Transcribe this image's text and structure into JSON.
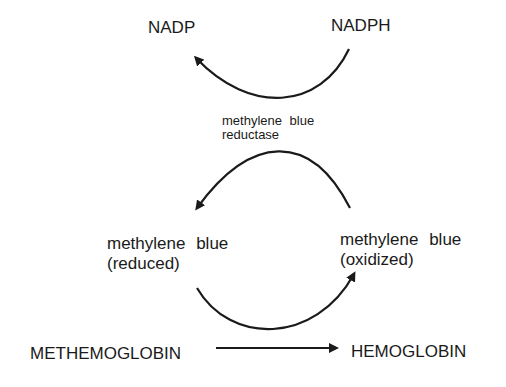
{
  "diagram": {
    "nadp": "NADP",
    "nadph": "NADPH",
    "enzyme_line1": "methylene blue",
    "enzyme_line2": "reductase",
    "mb_reduced_line1": "methylene blue",
    "mb_reduced_line2": "(reduced)",
    "mb_oxidized_line1": "methylene blue",
    "mb_oxidized_line2": "(oxidized)",
    "methemoglobin": "METHEMOGLOBIN",
    "hemoglobin": "HEMOGLOBIN",
    "arrows": [
      {
        "from": "NADPH",
        "to": "NADP"
      },
      {
        "from": "methylene blue (oxidized)",
        "to": "methylene blue (reduced)"
      },
      {
        "from": "methylene blue (reduced)",
        "to": "methylene blue (oxidized)"
      },
      {
        "from": "METHEMOGLOBIN",
        "to": "HEMOGLOBIN"
      }
    ]
  }
}
